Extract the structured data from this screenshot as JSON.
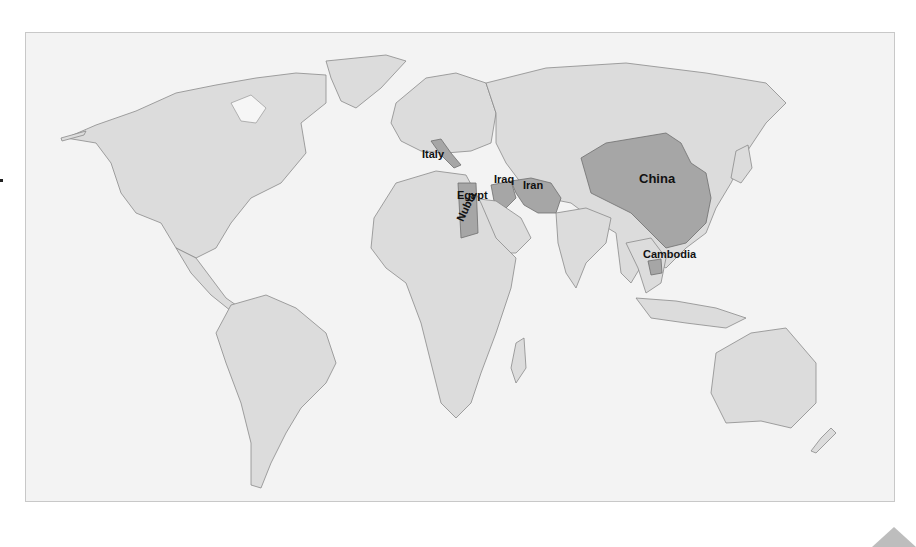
{
  "map": {
    "type": "world political map",
    "highlight_color": "#a6a6a6",
    "land_color": "#dcdcdc",
    "background_color": "#f3f3f3",
    "labels": [
      {
        "name": "Italy"
      },
      {
        "name": "Egypt"
      },
      {
        "name": "Nubia"
      },
      {
        "name": "Iraq"
      },
      {
        "name": "Iran"
      },
      {
        "name": "China"
      },
      {
        "name": "Cambodia"
      }
    ]
  },
  "nav": {
    "next_icon": "triangle-up-icon"
  }
}
